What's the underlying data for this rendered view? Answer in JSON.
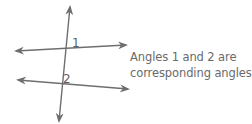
{
  "diagram": {
    "type": "parallel-lines-with-transversal",
    "line_color": "#6e6e6e",
    "lines": {
      "upper": {
        "x1": 16,
        "y1": 51,
        "x2": 126,
        "y2": 45
      },
      "lower": {
        "x1": 18,
        "y1": 80,
        "x2": 128,
        "y2": 89
      },
      "transversal": {
        "x1": 70,
        "y1": 7,
        "x2": 59,
        "y2": 121
      }
    },
    "angle_labels": [
      {
        "text": "1",
        "x": 72,
        "y": 47
      },
      {
        "text": "2",
        "x": 63,
        "y": 83
      }
    ]
  },
  "caption": {
    "line1": "Angles 1 and 2 are",
    "line2": "corresponding angles."
  }
}
